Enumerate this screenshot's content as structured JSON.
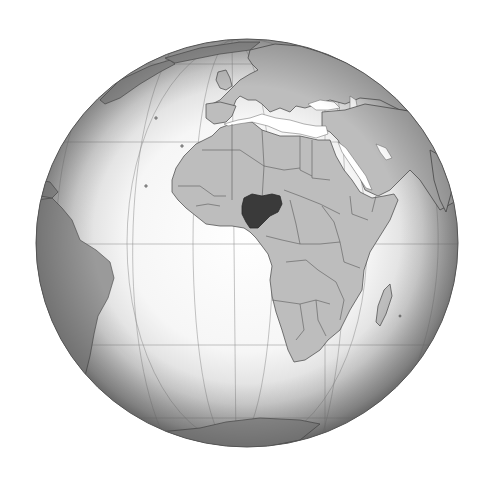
{
  "map": {
    "projection": "orthographic",
    "center_region": "Africa",
    "highlighted_country": "Nigeria",
    "colors": {
      "background": "#ffffff",
      "ocean_center": "#ffffff",
      "ocean_limb": "#8c8c8c",
      "land": "#bdbdbd",
      "border": "#555555",
      "highlight": "#3a3a3a",
      "graticule": "#8a8a8a"
    },
    "globe": {
      "cx": 247,
      "cy": 243,
      "rx": 211,
      "ry": 204
    },
    "regions_visible": [
      "Europe",
      "Africa",
      "Middle East",
      "South America",
      "Greenland",
      "Antarctica",
      "Madagascar"
    ]
  }
}
